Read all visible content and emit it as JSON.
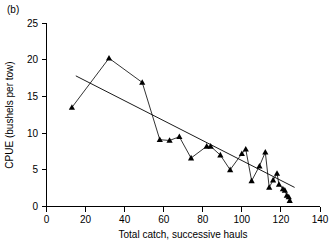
{
  "figure": {
    "panel_label": "(b)",
    "background_color": "#ffffff",
    "foreground_color": "#000000"
  },
  "chart_data": {
    "type": "line",
    "title": "",
    "subtitle": "",
    "panel": "(b)",
    "xlabel": "Total catch, successive hauls",
    "ylabel": "CPUE (bushels per tow)",
    "xlim": [
      0,
      140
    ],
    "ylim": [
      0,
      25
    ],
    "xticks": [
      0,
      20,
      40,
      60,
      80,
      100,
      120,
      140
    ],
    "yticks": [
      0,
      5,
      10,
      15,
      20,
      25
    ],
    "grid": false,
    "legend": null,
    "marker": "triangle-up",
    "marker_color": "#000000",
    "line_color": "#000000",
    "series": [
      {
        "name": "CPUE by successive haul",
        "kind": "line-with-markers",
        "x": [
          13,
          32,
          49,
          58,
          63,
          68,
          74,
          82,
          84,
          89,
          94,
          100,
          102,
          105,
          109,
          112,
          114,
          116,
          118,
          119,
          121,
          122,
          123,
          124,
          124.5
        ],
        "y": [
          13.5,
          20.2,
          16.9,
          9.1,
          9.0,
          9.5,
          6.6,
          8.2,
          8.2,
          7.0,
          5.0,
          7.2,
          7.8,
          3.5,
          5.5,
          7.4,
          2.6,
          3.6,
          4.5,
          3.0,
          2.4,
          2.2,
          1.5,
          1.3,
          0.8
        ]
      },
      {
        "name": "Linear regression trend",
        "kind": "line",
        "x": [
          15,
          127
        ],
        "y": [
          17.8,
          2.6
        ]
      }
    ]
  }
}
